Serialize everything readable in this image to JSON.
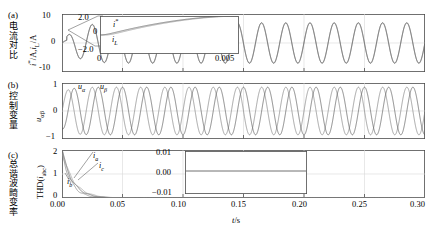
{
  "figure": {
    "xaxis": {
      "title": "t/s",
      "ticks": [
        "0.00",
        "0.05",
        "0.10",
        "0.15",
        "0.20",
        "0.25",
        "0.30"
      ],
      "min": 0.0,
      "max": 0.3
    },
    "line_colors": {
      "primary": "#808080",
      "secondary": "#595959",
      "third": "#9a9a9a",
      "frame": "#4d4d4d",
      "grid": "#d8d8d8"
    }
  },
  "panels": [
    {
      "tag": "(a)",
      "cn_label": "电流对比",
      "ylabel": "i*/A,i_L/A",
      "yticks": [
        "10",
        "0",
        "-10"
      ],
      "ylim": [
        -10,
        10
      ],
      "inset": {
        "yticks": [
          "2.0",
          "0",
          "-2.0"
        ],
        "xticks": [
          "0",
          "0.005"
        ],
        "ylim": [
          -2.0,
          2.0
        ],
        "xlim": [
          0,
          0.005
        ],
        "curve_labels": [
          "i*",
          "i_L"
        ]
      }
    },
    {
      "tag": "(b)",
      "cn_label": "控制变量",
      "ylabel": "u_αβ",
      "yticks": [
        "1",
        "0",
        "-1"
      ],
      "ylim": [
        -1,
        1
      ],
      "curve_labels": [
        "u_α",
        "u_β"
      ]
    },
    {
      "tag": "(c)",
      "cn_label": "总谐波畸变率",
      "ylabel": "THD(i_abc)",
      "yticks": [
        "2",
        "1",
        "0"
      ],
      "ylim": [
        0,
        2
      ],
      "curve_labels": [
        "i_a",
        "i_b",
        "i_c"
      ],
      "inset": {
        "yticks": [
          "0.01",
          "0.00",
          "-0.01"
        ],
        "ylim": [
          -0.01,
          0.01
        ],
        "xlim": [
          0.05,
          0.2
        ]
      }
    }
  ],
  "chart_data": {
    "type": "line",
    "title": "",
    "xlabel": "t/s",
    "subplots": [
      {
        "tag": "(a)",
        "ylabel": "i*/A, i_L/A",
        "xlim": [
          0.0,
          0.3
        ],
        "ylim": [
          -10,
          10
        ],
        "yticks": [
          -10,
          0,
          10
        ],
        "grid": true,
        "series": [
          {
            "name": "i*",
            "description": "reference current, sinusoid 50 Hz, amplitude ramps from 0 to 7 A after transient",
            "amplitude": 7.0,
            "frequency_hz": 50,
            "settling_time_s": 0.03
          },
          {
            "name": "i_L",
            "description": "load current tracking reference",
            "amplitude": 7.0,
            "frequency_hz": 50,
            "settling_time_s": 0.03
          }
        ],
        "inset": {
          "xlim": [
            0,
            0.005
          ],
          "ylim": [
            -2.0,
            2.0
          ],
          "yticks": [
            -2.0,
            0,
            2.0
          ],
          "xticks": [
            0,
            0.005
          ],
          "series": [
            {
              "name": "i*",
              "description": "rises to ~1 A then decays toward -2 A"
            },
            {
              "name": "i_L",
              "description": "follows i* with slight lag"
            }
          ]
        }
      },
      {
        "tag": "(b)",
        "ylabel": "u_αβ",
        "xlim": [
          0.0,
          0.3
        ],
        "ylim": [
          -1,
          1
        ],
        "yticks": [
          -1,
          0,
          1
        ],
        "grid": true,
        "series": [
          {
            "name": "u_α",
            "amplitude": 0.85,
            "frequency_hz": 50,
            "phase_deg": 0
          },
          {
            "name": "u_β",
            "amplitude": 0.85,
            "frequency_hz": 50,
            "phase_deg": -90
          }
        ]
      },
      {
        "tag": "(c)",
        "ylabel": "THD(i_abc)",
        "xlim": [
          0.0,
          0.3
        ],
        "ylim": [
          0,
          2
        ],
        "yticks": [
          0,
          1,
          2
        ],
        "grid": true,
        "series": [
          {
            "name": "i_a",
            "description": "THD decays from 2 to ~0 by t=0.035 s"
          },
          {
            "name": "i_b",
            "description": "THD decays from 2 to ~0 by t=0.035 s"
          },
          {
            "name": "i_c",
            "description": "THD decays from 2 to ~0 by t=0.035 s"
          }
        ],
        "inset": {
          "xlim": [
            0.05,
            0.2
          ],
          "ylim": [
            -0.01,
            0.01
          ],
          "yticks": [
            -0.01,
            0.0,
            0.01
          ],
          "series": [
            {
              "name": "THD zoom",
              "description": "flat near 0.001"
            }
          ]
        }
      }
    ]
  }
}
